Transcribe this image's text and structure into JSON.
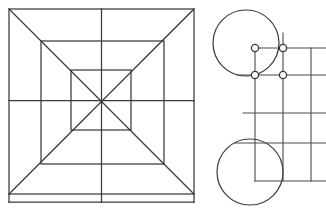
{
  "page": {
    "background_color": "#ffffff",
    "width": 326,
    "height": 219
  },
  "style": {
    "line_color": "#3a3a3a",
    "line_color_secondary": "#4a4a4a",
    "node_fill_color": "#ffffff",
    "line_width": 1.25,
    "node_radius": 3.6
  },
  "figures": [
    {
      "id": "left-figure",
      "name": "nested-squares-diagram",
      "description": "Three concentric squares with full diagonals and median cross lines",
      "squares": [
        {
          "name": "outer-square",
          "x": 9,
          "y": 9,
          "size": 185
        },
        {
          "name": "middle-square",
          "x": 41,
          "y": 41,
          "size": 123
        },
        {
          "name": "inner-square",
          "x": 71,
          "y": 70,
          "size": 60
        }
      ],
      "center": {
        "x": 101.5,
        "y": 100.5
      },
      "diagonals": [
        {
          "name": "diagonal-tl-br",
          "x1": 9,
          "y1": 9,
          "x2": 194,
          "y2": 194
        },
        {
          "name": "diagonal-tr-bl",
          "x1": 194,
          "y1": 9,
          "x2": 9,
          "y2": 194
        }
      ],
      "medians": [
        {
          "name": "median-vertical",
          "x1": 101.5,
          "y1": 9,
          "x2": 101.5,
          "y2": 202
        },
        {
          "name": "median-horizontal",
          "x1": 9,
          "y1": 100.5,
          "x2": 194,
          "y2": 100.5
        }
      ],
      "bottom_extension": {
        "name": "bottom-edge-extension",
        "x1": 9,
        "y1": 202,
        "x2": 194,
        "y2": 202
      }
    },
    {
      "id": "right-figure",
      "name": "circles-and-grid-diagram",
      "description": "Two large circles joined by an orthogonal grid carrying four node markers",
      "circles": [
        {
          "name": "upper-circle",
          "cx": 246,
          "cy": 43,
          "r": 33
        },
        {
          "name": "lower-circle",
          "cx": 250,
          "cy": 172,
          "r": 33
        }
      ],
      "grid": {
        "vertical_lines": [
          {
            "name": "grid-vline-1",
            "x": 255,
            "y1": 48,
            "y2": 181
          },
          {
            "name": "grid-vline-2",
            "x": 283,
            "y1": 33,
            "y2": 181
          },
          {
            "name": "grid-vline-3",
            "x": 311,
            "y1": 48,
            "y2": 181
          }
        ],
        "horizontal_lines": [
          {
            "name": "grid-hline-1",
            "y": 48,
            "x1": 255,
            "x2": 326
          },
          {
            "name": "grid-hline-2",
            "y": 75,
            "x1": 237,
            "x2": 326
          },
          {
            "name": "grid-hline-3",
            "y": 113,
            "x1": 243,
            "x2": 326
          },
          {
            "name": "grid-hline-4",
            "y": 143,
            "x1": 235,
            "x2": 326
          },
          {
            "name": "grid-hline-5",
            "y": 181,
            "x1": 255,
            "x2": 326
          }
        ]
      },
      "nodes": [
        {
          "name": "node-top-left",
          "cx": 255,
          "cy": 48
        },
        {
          "name": "node-top-right",
          "cx": 283,
          "cy": 48
        },
        {
          "name": "node-bottom-left",
          "cx": 255,
          "cy": 75
        },
        {
          "name": "node-bottom-right",
          "cx": 283,
          "cy": 75
        }
      ]
    }
  ]
}
